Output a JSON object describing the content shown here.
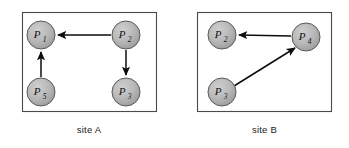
{
  "figure": {
    "background": "#ffffff",
    "panel_border_color": "#4a4a4a",
    "node_fill": "#b4b4b4",
    "node_stroke": "#5a5a5a",
    "edge_color": "#0d0d0d",
    "label_color": "#111111"
  },
  "panels": [
    {
      "id": "site-a",
      "caption": "site A",
      "box": {
        "x": 22,
        "y": 12,
        "w": 134,
        "h": 99
      },
      "nodes": [
        {
          "id": "a-p1",
          "symbol": "P",
          "subscript": "1",
          "cx": 41,
          "cy": 35,
          "r": 14
        },
        {
          "id": "a-p2",
          "symbol": "P",
          "subscript": "2",
          "cx": 126,
          "cy": 35,
          "r": 14
        },
        {
          "id": "a-p5",
          "symbol": "P",
          "subscript": "5",
          "cx": 41,
          "cy": 92,
          "r": 14
        },
        {
          "id": "a-p3",
          "symbol": "P",
          "subscript": "3",
          "cx": 126,
          "cy": 92,
          "r": 14
        }
      ],
      "edges": [
        {
          "id": "a-e1",
          "from": "a-p2",
          "to": "a-p1",
          "direction": "horizontal-left"
        },
        {
          "id": "a-e2",
          "from": "a-p5",
          "to": "a-p1",
          "direction": "vertical-up"
        },
        {
          "id": "a-e3",
          "from": "a-p2",
          "to": "a-p3",
          "direction": "vertical-down"
        }
      ]
    },
    {
      "id": "site-b",
      "caption": "site B",
      "box": {
        "x": 197,
        "y": 12,
        "w": 134,
        "h": 99
      },
      "nodes": [
        {
          "id": "b-p2",
          "symbol": "P",
          "subscript": "2",
          "cx": 222,
          "cy": 35,
          "r": 14
        },
        {
          "id": "b-p4",
          "symbol": "P",
          "subscript": "4",
          "cx": 306,
          "cy": 37,
          "r": 14
        },
        {
          "id": "b-p3",
          "symbol": "P",
          "subscript": "3",
          "cx": 222,
          "cy": 92,
          "r": 14
        }
      ],
      "edges": [
        {
          "id": "b-e1",
          "from": "b-p4",
          "to": "b-p2",
          "direction": "horizontal-left"
        },
        {
          "id": "b-e2",
          "from": "b-p3",
          "to": "b-p4",
          "direction": "diagonal-up-right"
        }
      ]
    }
  ]
}
